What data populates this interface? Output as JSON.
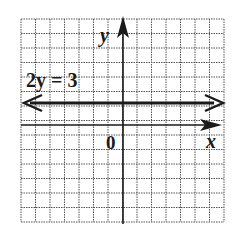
{
  "chart_data": {
    "type": "line",
    "title": "",
    "xlabel": "x",
    "ylabel": "y",
    "origin_label": "0",
    "xlim": [
      -7,
      7
    ],
    "ylim": [
      -7,
      7
    ],
    "grid": true,
    "series": [
      {
        "name": "2y = 3",
        "equation": "2y = 3",
        "x": [
          -7,
          7
        ],
        "y": [
          1.5,
          1.5
        ]
      }
    ],
    "annotations": [
      {
        "text": "2y = 3",
        "x": -7,
        "y": 2.2
      }
    ]
  },
  "labels": {
    "equation": "2y = 3",
    "x_axis": "x",
    "y_axis": "y",
    "origin": "0"
  },
  "colors": {
    "grid": "#555555",
    "axis": "#1a1a1a",
    "line": "#1a1a1a"
  }
}
